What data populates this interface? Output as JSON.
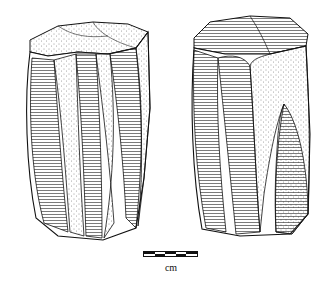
{
  "figure": {
    "views": [
      {
        "name": "core-view-left"
      },
      {
        "name": "core-view-right"
      }
    ],
    "scale_bar": {
      "unit_label": "cm",
      "segments": 5,
      "top_row": [
        "black",
        "white",
        "black",
        "white",
        "black"
      ],
      "bottom_row": [
        "white",
        "black",
        "white",
        "black",
        "white"
      ]
    },
    "colors": {
      "ink": "#111111",
      "paper": "#ffffff"
    }
  }
}
